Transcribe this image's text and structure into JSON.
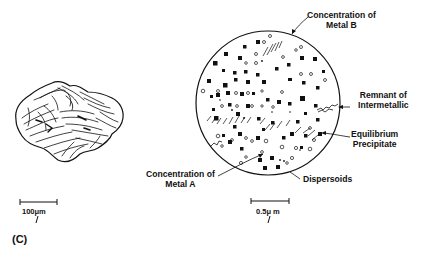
{
  "figure": {
    "panel_label": "(C)",
    "left_view": {
      "subject": "particle-macro-view",
      "scale_bar": {
        "label": "100μm"
      }
    },
    "right_view": {
      "subject": "microstructure-detail-circle",
      "scale_bar": {
        "label": "0.5μ m"
      },
      "annotations": [
        {
          "id": "metal-b",
          "lines": [
            "Concentration of",
            "Metal B"
          ]
        },
        {
          "id": "intermetallic",
          "lines": [
            "Remnant of",
            "Intermetallic"
          ]
        },
        {
          "id": "precipitate",
          "lines": [
            "Equilibrium",
            "Precipitate"
          ]
        },
        {
          "id": "dispersoids",
          "lines": [
            "Dispersoids"
          ]
        },
        {
          "id": "metal-a",
          "lines": [
            "Concentration of",
            "Metal A"
          ]
        }
      ]
    }
  }
}
